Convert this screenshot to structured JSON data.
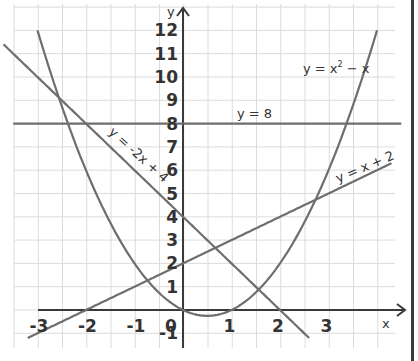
{
  "chart_data": {
    "type": "line",
    "title": "",
    "xlabel": "x",
    "ylabel": "y",
    "xlim": [
      -3.5,
      4.5
    ],
    "ylim": [
      -1.5,
      12.5
    ],
    "grid": true,
    "x_ticks": [
      "-3",
      "-2",
      "-1",
      "0",
      "1",
      "2",
      "3"
    ],
    "y_ticks": [
      "-1",
      "1",
      "2",
      "3",
      "4",
      "5",
      "6",
      "7",
      "8",
      "9",
      "10",
      "11",
      "12"
    ],
    "series": [
      {
        "name": "y = x² − x",
        "label": "y = x² − x",
        "formula": "x^2 - x",
        "x_range": [
          -3,
          4
        ]
      },
      {
        "name": "y = -2x + 4",
        "label": "y = -2x + 4",
        "formula": "-2x + 4",
        "x_range": [
          -3.7,
          2.6
        ]
      },
      {
        "name": "y = 8",
        "label": "y = 8",
        "formula": "8",
        "x_range": [
          -3.5,
          4.5
        ]
      },
      {
        "name": "y = x + 2",
        "label": "y = x + 2",
        "formula": "x + 2",
        "x_range": [
          -3.2,
          4.3
        ]
      }
    ],
    "colors": {
      "curves": "#6e6e6e",
      "axes": "#3a3a3a",
      "grid": "#dcdcdc"
    }
  },
  "labels": {
    "x_axis": "x",
    "y_axis": "y",
    "eq_parabola": "y = x² − x",
    "eq_line_neg": "y = -2x + 4",
    "eq_horizontal": "y = 8",
    "eq_line_pos": "y = x + 2"
  }
}
